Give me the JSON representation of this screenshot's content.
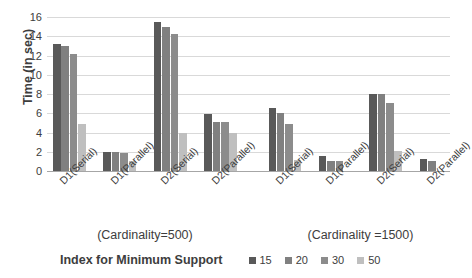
{
  "chart_data": {
    "type": "bar",
    "title": "",
    "xlabel": "Index for Minimum Support",
    "ylabel": "Time  (in sec)",
    "ylim": [
      0,
      16
    ],
    "yticks": [
      0,
      2,
      4,
      6,
      8,
      10,
      12,
      14,
      16
    ],
    "grid": true,
    "legend_position": "bottom",
    "categories": [
      "D1(Serial)",
      "D1(Parallel)",
      "D2(Serial)",
      "D2(Parallel)",
      "D1(Serial)",
      "D1(Parallel)",
      "D2(Serial)",
      "D2(Parallel)"
    ],
    "group_captions": [
      "(Cardinality=500)",
      "(Cardinality =1500)"
    ],
    "series": [
      {
        "name": "15",
        "color": "#595959",
        "values": [
          13.2,
          2.0,
          15.5,
          5.9,
          6.5,
          1.6,
          8.0,
          1.3
        ]
      },
      {
        "name": "20",
        "color": "#808080",
        "values": [
          13.0,
          2.0,
          15.0,
          5.1,
          6.0,
          1.0,
          8.0,
          1.0
        ]
      },
      {
        "name": "30",
        "color": "#8c8c8c",
        "values": [
          12.2,
          1.9,
          14.2,
          5.1,
          4.9,
          1.0,
          7.1,
          0.0
        ]
      },
      {
        "name": "50",
        "color": "#bfbfbf",
        "values": [
          4.9,
          1.0,
          4.0,
          3.9,
          1.1,
          0.0,
          2.1,
          0.0
        ]
      }
    ]
  }
}
